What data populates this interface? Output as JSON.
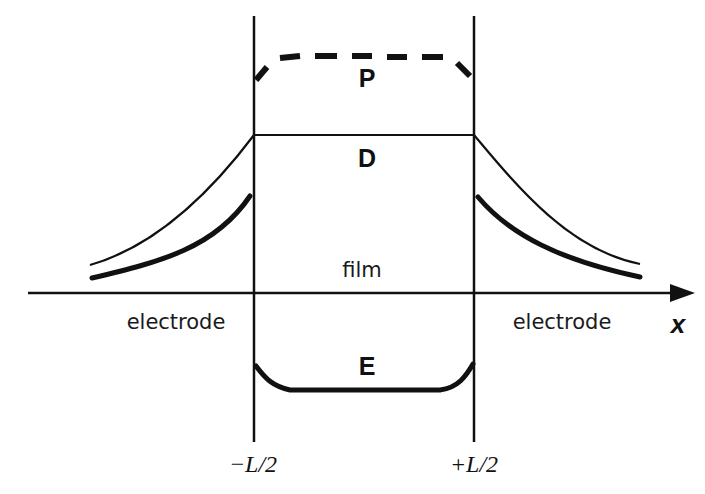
{
  "diagram": {
    "regions": {
      "left": "electrode",
      "center": "film",
      "right": "electrode"
    },
    "curves": {
      "P": {
        "label": "P",
        "style": "thick dashed"
      },
      "D": {
        "label": "D",
        "style": "thin solid"
      },
      "E": {
        "label": "E",
        "style": "thick solid"
      }
    },
    "axis": {
      "label": "x"
    },
    "boundaries": {
      "left": "−L/2",
      "right": "+L/2"
    },
    "colors": {
      "line": "#111111",
      "background": "#ffffff"
    }
  }
}
